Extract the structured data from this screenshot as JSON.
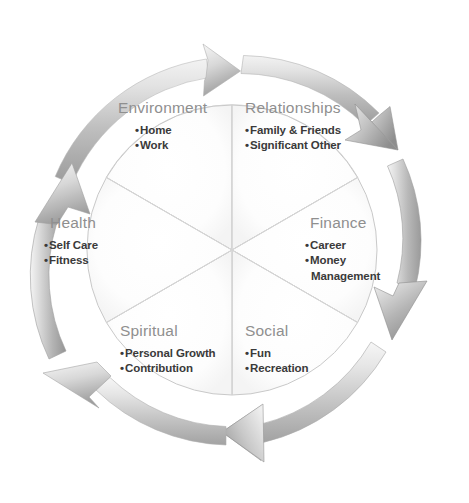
{
  "diagram": {
    "type": "cycle-wheel",
    "segment_count": 6,
    "flow_direction": "clockwise",
    "colors": {
      "arrow_light": "#e9e9e9",
      "arrow_mid": "#bdbdbd",
      "arrow_dark": "#8d8d8d",
      "segment_fill": "#fdfdfd",
      "segment_stroke": "#cfcfcf",
      "heading_text": "#8f8f8f",
      "item_text": "#3a3a3a"
    },
    "segments": [
      {
        "id": "environment",
        "label": "Environment",
        "items": [
          "Home",
          "Work"
        ]
      },
      {
        "id": "relationships",
        "label": "Relationships",
        "items": [
          "Family & Friends",
          "Significant Other"
        ]
      },
      {
        "id": "finance",
        "label": "Finance",
        "items": [
          "Career",
          "Money Management"
        ]
      },
      {
        "id": "social",
        "label": "Social",
        "items": [
          "Fun",
          "Recreation"
        ]
      },
      {
        "id": "spiritual",
        "label": "Spiritual",
        "items": [
          "Personal Growth",
          "Contribution"
        ]
      },
      {
        "id": "health",
        "label": "Health",
        "items": [
          "Self Care",
          "Fitness"
        ]
      }
    ],
    "arrows": [
      {
        "id": "arrow-top",
        "points_to": "right"
      },
      {
        "id": "arrow-upper-right",
        "points_to": "down-right"
      },
      {
        "id": "arrow-lower-right",
        "points_to": "down"
      },
      {
        "id": "arrow-bottom",
        "points_to": "left"
      },
      {
        "id": "arrow-lower-left",
        "points_to": "up-left"
      },
      {
        "id": "arrow-upper-left",
        "points_to": "up"
      }
    ],
    "bullet_glyph": "•"
  }
}
